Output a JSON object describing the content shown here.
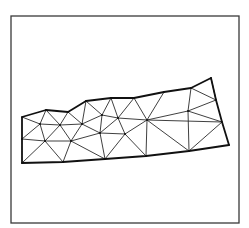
{
  "figure": {
    "type": "triangular-mesh",
    "frame": {
      "x1": 11,
      "y1": 16,
      "x2": 239,
      "y2": 223,
      "color": "#3a3a3a"
    },
    "line_color": "#2a2a2a",
    "boundary_color": "#111111",
    "vertices": {
      "A": [
        22,
        117
      ],
      "B": [
        46,
        110
      ],
      "C": [
        68,
        112
      ],
      "D": [
        86,
        101
      ],
      "E": [
        111,
        98
      ],
      "F": [
        134,
        98
      ],
      "G": [
        164,
        92
      ],
      "H": [
        191,
        88
      ],
      "I": [
        211,
        78
      ],
      "J": [
        216,
        100
      ],
      "K": [
        222,
        122
      ],
      "L": [
        229,
        145
      ],
      "M": [
        189,
        151
      ],
      "N": [
        146,
        156
      ],
      "O": [
        105,
        159
      ],
      "P": [
        63,
        162
      ],
      "Q": [
        22,
        163
      ],
      "R": [
        22,
        139
      ],
      "S": [
        40,
        124
      ],
      "T": [
        60,
        125
      ],
      "U": [
        82,
        124
      ],
      "V": [
        102,
        115
      ],
      "W": [
        118,
        118
      ],
      "X": [
        147,
        120
      ],
      "Y": [
        188,
        111
      ],
      "Z": [
        45,
        141
      ],
      "AA": [
        71,
        141
      ],
      "AB": [
        100,
        133
      ],
      "AC": [
        125,
        134
      ]
    },
    "boundary": [
      "A",
      "B",
      "C",
      "D",
      "E",
      "F",
      "G",
      "H",
      "I",
      "J",
      "K",
      "L",
      "M",
      "N",
      "O",
      "P",
      "Q",
      "R",
      "A"
    ],
    "edges": [
      [
        "A",
        "S"
      ],
      [
        "B",
        "S"
      ],
      [
        "B",
        "T"
      ],
      [
        "C",
        "T"
      ],
      [
        "C",
        "U"
      ],
      [
        "D",
        "U"
      ],
      [
        "D",
        "V"
      ],
      [
        "E",
        "V"
      ],
      [
        "E",
        "W"
      ],
      [
        "F",
        "W"
      ],
      [
        "F",
        "X"
      ],
      [
        "G",
        "X"
      ],
      [
        "H",
        "Y"
      ],
      [
        "I",
        "J"
      ],
      [
        "J",
        "Y"
      ],
      [
        "Y",
        "K"
      ],
      [
        "K",
        "X"
      ],
      [
        "X",
        "Y"
      ],
      [
        "Y",
        "M"
      ],
      [
        "K",
        "M"
      ],
      [
        "S",
        "T"
      ],
      [
        "T",
        "U"
      ],
      [
        "U",
        "V"
      ],
      [
        "V",
        "W"
      ],
      [
        "W",
        "X"
      ],
      [
        "R",
        "S"
      ],
      [
        "S",
        "Z"
      ],
      [
        "T",
        "Z"
      ],
      [
        "T",
        "AA"
      ],
      [
        "U",
        "AA"
      ],
      [
        "U",
        "AB"
      ],
      [
        "V",
        "AB"
      ],
      [
        "W",
        "AB"
      ],
      [
        "W",
        "AC"
      ],
      [
        "X",
        "AC"
      ],
      [
        "R",
        "Z"
      ],
      [
        "Z",
        "AA"
      ],
      [
        "AA",
        "AB"
      ],
      [
        "AB",
        "AC"
      ],
      [
        "Q",
        "Z"
      ],
      [
        "Z",
        "P"
      ],
      [
        "AA",
        "P"
      ],
      [
        "AA",
        "O"
      ],
      [
        "AB",
        "O"
      ],
      [
        "AC",
        "O"
      ],
      [
        "AC",
        "N"
      ],
      [
        "X",
        "N"
      ],
      [
        "X",
        "M"
      ],
      [
        "H",
        "J"
      ]
    ]
  }
}
